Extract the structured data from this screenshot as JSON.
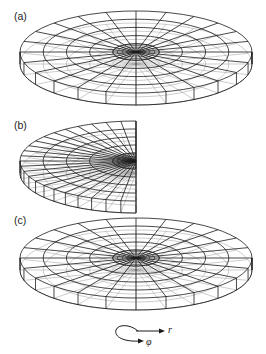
{
  "figure": {
    "panels": [
      {
        "id": "a",
        "label": "(a)",
        "type": "full-disk",
        "label_pos": [
          14,
          18
        ],
        "center": [
          136,
          52
        ],
        "rx": 116,
        "ry": 41,
        "depth": 12,
        "rings": 5,
        "spokes": 24
      },
      {
        "id": "b",
        "label": "(b)",
        "type": "half-disk",
        "label_pos": [
          14,
          126
        ],
        "center": [
          136,
          161
        ],
        "rx": 116,
        "ry": 40,
        "depth": 12,
        "rings": 5,
        "spokes": 24
      },
      {
        "id": "c",
        "label": "(c)",
        "type": "full-disk",
        "label_pos": [
          14,
          222
        ],
        "center": [
          136,
          258
        ],
        "rx": 116,
        "ry": 40,
        "depth": 12,
        "rings": 5,
        "spokes": 24
      }
    ],
    "legend": {
      "r_label": "r",
      "phi_label": "φ"
    },
    "colors": {
      "line": "#1a1a1a",
      "hidden_line": "#9a9a9a",
      "background": "#ffffff"
    }
  }
}
